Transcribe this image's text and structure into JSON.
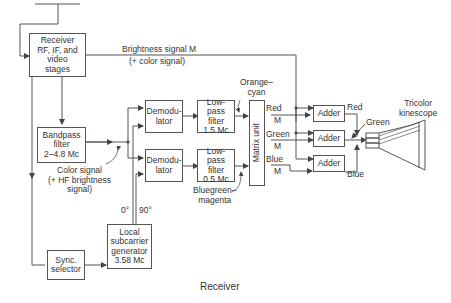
{
  "blocks": {
    "receiver": [
      "Receiver",
      "RF, IF, and",
      "video",
      "stages"
    ],
    "bandpass": [
      "Bandpass",
      "filter",
      "2–4.8 Mc"
    ],
    "sync": [
      "Sync.",
      "selector"
    ],
    "subcarrier": [
      "Local",
      "subcarrier",
      "generator",
      "3.58 Mc"
    ],
    "demod1": [
      "Demodu-",
      "lator"
    ],
    "demod2": [
      "Demodu-",
      "lator"
    ],
    "lpf1": [
      "Low-pass",
      "filter",
      "1.5 Mc"
    ],
    "lpf2": [
      "Low-pass",
      "filter",
      "0.5 Mc"
    ],
    "matrix": "Matrix unit",
    "adder1": "Adder",
    "adder2": "Adder",
    "adder3": "Adder"
  },
  "labels": {
    "brightness": "Brightness signal M",
    "brightness_sub": "(+ color signal)",
    "color_signal": [
      "Color signal",
      "(+ HF brightness",
      "signal)"
    ],
    "orange_cyan": [
      "Orange–",
      "cyan"
    ],
    "bluegreen_magenta": [
      "Bluegreen–",
      "magenta"
    ],
    "phase0": "0°",
    "phase90": "90°",
    "red": "Red",
    "green": "Green",
    "blue": "Blue",
    "m": "M",
    "out_red": "Red",
    "out_green": "Green",
    "out_blue": "Blue",
    "kinescope": [
      "Tricolor",
      "kinescope"
    ]
  },
  "caption": "Receiver"
}
